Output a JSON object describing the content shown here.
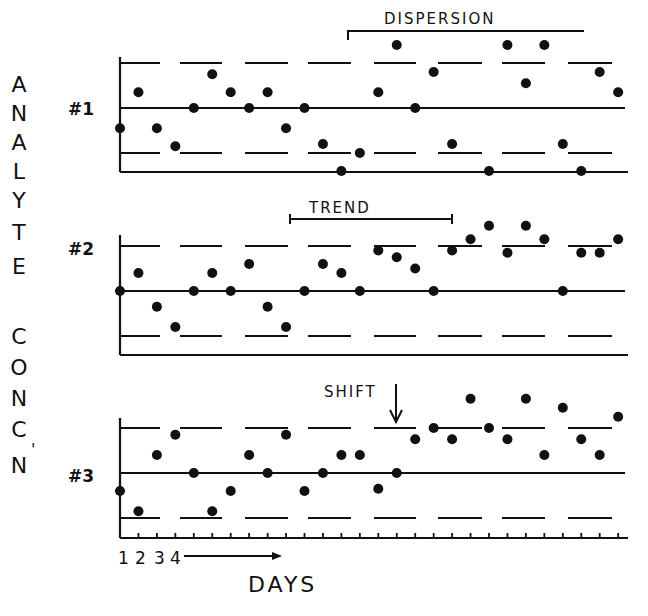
{
  "chart_data": {
    "type": "scatter",
    "title": "",
    "xlabel": "DAYS",
    "ylabel": "ANALYTE CONC'N",
    "x_tick_labels": [
      "1",
      "2",
      "3",
      "4"
    ],
    "x_arrow": "days increasing",
    "grid": false,
    "units": "standard deviations from mean (mean = 0, dashed limits = ±2)",
    "panels": [
      {
        "name": "#1",
        "annotation": "DISPERSION",
        "annotation_span_days": [
          14,
          27
        ],
        "control_limits": {
          "upper": 2,
          "mean": 0,
          "lower": -2
        },
        "x": [
          1,
          2,
          3,
          4,
          5,
          6,
          7,
          8,
          9,
          10,
          11,
          12,
          13,
          14,
          15,
          16,
          17,
          18,
          19,
          21,
          22,
          23,
          24,
          25,
          26,
          27,
          28
        ],
        "values": [
          -0.9,
          0.7,
          -0.9,
          -1.7,
          0,
          1.5,
          0.7,
          0,
          0.7,
          -0.9,
          0,
          -1.6,
          -2.8,
          -2.0,
          0.7,
          2.8,
          0,
          1.6,
          -1.6,
          -2.8,
          2.8,
          1.1,
          2.8,
          -1.6,
          -2.8,
          1.6,
          0.7
        ]
      },
      {
        "name": "#2",
        "annotation": "TREND",
        "annotation_span_days": [
          10,
          19
        ],
        "control_limits": {
          "upper": 2,
          "mean": 0,
          "lower": -2
        },
        "x": [
          1,
          2,
          3,
          4,
          5,
          6,
          7,
          8,
          9,
          10,
          11,
          12,
          13,
          14,
          15,
          16,
          17,
          18,
          19,
          20,
          21,
          22,
          23,
          24,
          25,
          26,
          27,
          28
        ],
        "values": [
          0,
          0.8,
          -0.7,
          -1.6,
          0,
          0.8,
          0,
          1.2,
          -0.7,
          -1.6,
          0,
          1.2,
          0.8,
          0,
          1.8,
          1.5,
          1.0,
          0,
          1.8,
          2.3,
          2.9,
          1.7,
          2.9,
          2.3,
          0,
          1.7,
          1.7,
          2.3
        ]
      },
      {
        "name": "#3",
        "annotation": "SHIFT",
        "annotation_day": 16,
        "control_limits": {
          "upper": 2,
          "mean": 0,
          "lower": -2
        },
        "x": [
          1,
          2,
          3,
          4,
          5,
          6,
          7,
          8,
          9,
          10,
          11,
          12,
          13,
          14,
          15,
          16,
          17,
          18,
          19,
          20,
          21,
          22,
          23,
          24,
          25,
          26,
          27,
          28
        ],
        "values": [
          -0.8,
          -1.7,
          0.8,
          1.7,
          0,
          -1.7,
          -0.8,
          0.8,
          0,
          1.7,
          -0.8,
          0,
          0.8,
          0.8,
          -0.7,
          0,
          1.5,
          2.0,
          1.5,
          3.3,
          2.0,
          1.5,
          3.3,
          0.8,
          2.9,
          1.5,
          0.8,
          2.5
        ]
      }
    ]
  },
  "labels": {
    "ylabel_letters": [
      "A",
      "N",
      "A",
      "L",
      "Y",
      "T",
      "E",
      "",
      "C",
      "O",
      "N",
      "C",
      "N"
    ],
    "ylabel_apostrophe": "'",
    "panel1": "#1",
    "panel2": "#2",
    "panel3": "#3",
    "dispersion": "DISPERSION",
    "trend": "TREND",
    "shift": "SHIFT",
    "x1": "1",
    "x2": "2",
    "x3": "3",
    "x4": "4",
    "xtitle": "DAYS"
  }
}
